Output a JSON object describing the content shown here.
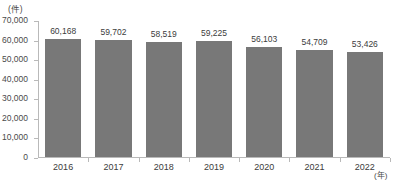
{
  "chart_data": {
    "type": "bar",
    "title": "",
    "xlabel": "(年)",
    "ylabel": "(件)",
    "categories": [
      "2016",
      "2017",
      "2018",
      "2019",
      "2020",
      "2021",
      "2022"
    ],
    "values": [
      60168,
      59702,
      58519,
      59225,
      56103,
      54709,
      53426
    ],
    "value_labels": [
      "60,168",
      "59,702",
      "58,519",
      "59,225",
      "56,103",
      "54,709",
      "53,426"
    ],
    "ylim": [
      0,
      70000
    ],
    "ytick_labels": [
      "70,000",
      "60,000",
      "50,000",
      "40,000",
      "30,000",
      "20,000",
      "10,000",
      "0"
    ],
    "ytick_values": [
      70000,
      60000,
      50000,
      40000,
      30000,
      20000,
      10000,
      0
    ],
    "grid": false,
    "legend": null,
    "bar_color": "#787878",
    "axis_color": "#b9b9b9",
    "background": "#ffffff"
  },
  "caption": {
    "text": ""
  }
}
